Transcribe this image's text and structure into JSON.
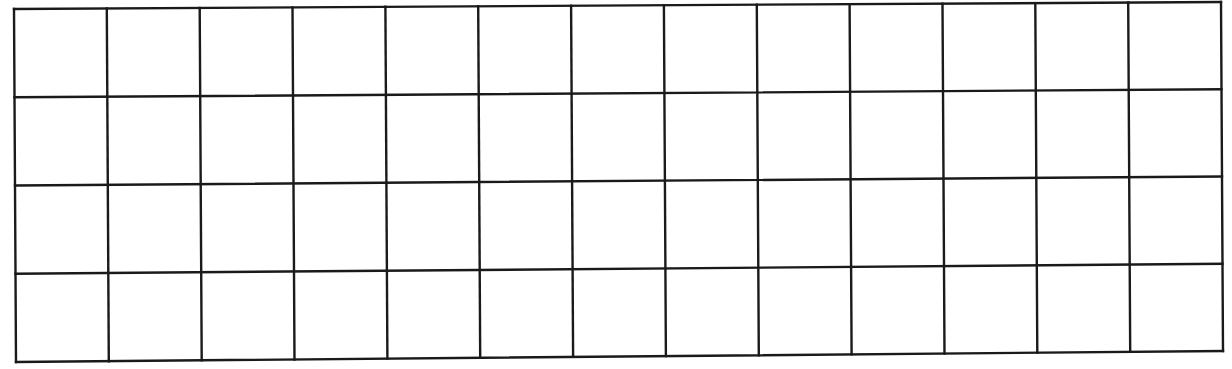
{
  "diagram": {
    "type": "empty-grid",
    "columns": 13,
    "rows": 4,
    "line_color": "#1a1a1a",
    "background": "#ffffff",
    "corners": {
      "top_left": [
        14,
        9
      ],
      "top_right": [
        1221,
        2
      ],
      "bottom_right": [
        1223,
        351
      ],
      "bottom_left": [
        16,
        362
      ]
    },
    "cells": []
  }
}
